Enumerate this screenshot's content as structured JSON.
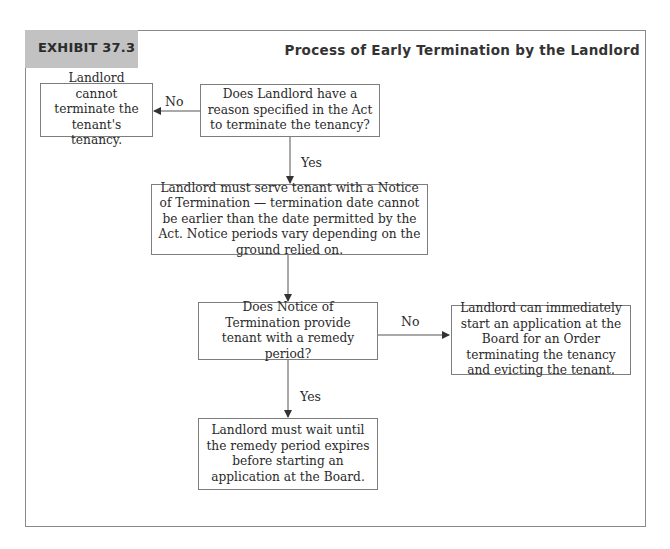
{
  "exhibit": {
    "tab_label": "EXHIBIT 37.3",
    "title": "Process of Early Termination by the Landlord"
  },
  "nodes": {
    "cannot_terminate": "Landlord cannot terminate the tenant's tenancy.",
    "reason_question": "Does Landlord have a reason specified in the Act to terminate the tenancy?",
    "serve_notice": "Landlord must serve tenant with a Notice of Termination — termination date cannot be earlier than the date permitted by the Act. Notice periods vary depending on the ground relied on.",
    "remedy_question": "Does Notice of Termination provide tenant with a remedy period?",
    "immediate_application": "Landlord can immediately start an application at the Board for an Order terminating the tenancy and evicting the tenant.",
    "wait_remedy": "Landlord must wait until the remedy period expires before starting an application at the Board."
  },
  "edges": {
    "reason_no": "No",
    "reason_yes": "Yes",
    "remedy_no": "No",
    "remedy_yes": "Yes"
  },
  "colors": {
    "tab_fill": "#c2c2c2",
    "frame_border": "#8a8a8a",
    "box_border": "#7d7d7d",
    "line": "#444444"
  }
}
